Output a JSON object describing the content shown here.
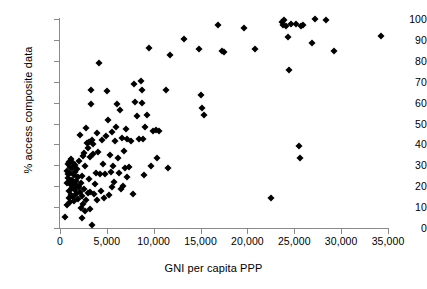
{
  "chart_data": {
    "type": "scatter",
    "title": "",
    "xlabel": "GNI per capita PPP",
    "ylabel": "% access composite data",
    "xlim": [
      0,
      35000
    ],
    "ylim": [
      0,
      100
    ],
    "xticks": [
      0,
      5000,
      10000,
      15000,
      20000,
      25000,
      30000,
      35000
    ],
    "xtick_labels": [
      "0",
      "5,000",
      "10,000",
      "15,000",
      "20,000",
      "25,000",
      "30,000",
      "35,000"
    ],
    "yticks": [
      0,
      10,
      20,
      30,
      40,
      50,
      60,
      70,
      80,
      90,
      100
    ],
    "ytick_labels": [
      "0",
      "10",
      "20",
      "30",
      "40",
      "50",
      "60",
      "70",
      "80",
      "90",
      "100"
    ],
    "grid": false,
    "legend": false,
    "marker": "diamond",
    "marker_color": "#000000",
    "series": [
      {
        "name": "countries",
        "points": [
          [
            520,
            5.2
          ],
          [
            700,
            21.5
          ],
          [
            780,
            11.0
          ],
          [
            800,
            27.5
          ],
          [
            830,
            30.5
          ],
          [
            860,
            26.0
          ],
          [
            900,
            24.0
          ],
          [
            930,
            14.5
          ],
          [
            950,
            31.5
          ],
          [
            980,
            22.0
          ],
          [
            1010,
            17.5
          ],
          [
            1050,
            29.0
          ],
          [
            1080,
            12.5
          ],
          [
            1120,
            26.5
          ],
          [
            1150,
            20.5
          ],
          [
            1180,
            33.0
          ],
          [
            1200,
            16.0
          ],
          [
            1250,
            23.0
          ],
          [
            1290,
            28.5
          ],
          [
            1320,
            19.0
          ],
          [
            1360,
            31.0
          ],
          [
            1400,
            15.0
          ],
          [
            1450,
            25.5
          ],
          [
            1480,
            21.0
          ],
          [
            1520,
            13.0
          ],
          [
            1560,
            27.0
          ],
          [
            1600,
            18.0
          ],
          [
            1650,
            30.0
          ],
          [
            1700,
            22.5
          ],
          [
            1750,
            16.5
          ],
          [
            1800,
            20.0
          ],
          [
            1850,
            28.0
          ],
          [
            1900,
            14.0
          ],
          [
            1950,
            24.5
          ],
          [
            2000,
            32.0
          ],
          [
            2050,
            19.5
          ],
          [
            2100,
            17.0
          ],
          [
            2150,
            44.5
          ],
          [
            2200,
            9.5
          ],
          [
            2250,
            21.5
          ],
          [
            2300,
            4.8
          ],
          [
            2350,
            15.5
          ],
          [
            2400,
            25.0
          ],
          [
            2450,
            11.5
          ],
          [
            2500,
            34.5
          ],
          [
            2550,
            18.5
          ],
          [
            2600,
            36.0
          ],
          [
            2650,
            29.5
          ],
          [
            2700,
            8.0
          ],
          [
            2750,
            47.8
          ],
          [
            2800,
            13.5
          ],
          [
            2900,
            40.5
          ],
          [
            2950,
            16.8
          ],
          [
            3000,
            38.5
          ],
          [
            3050,
            23.5
          ],
          [
            3100,
            41.0
          ],
          [
            3150,
            17.2
          ],
          [
            3200,
            34.0
          ],
          [
            3250,
            9.2
          ],
          [
            3300,
            66.0
          ],
          [
            3350,
            59.5
          ],
          [
            3400,
            1.2
          ],
          [
            3450,
            42.0
          ],
          [
            3500,
            35.5
          ],
          [
            3550,
            40.0
          ],
          [
            3600,
            16.5
          ],
          [
            3700,
            21.0
          ],
          [
            3800,
            26.5
          ],
          [
            3900,
            13.5
          ],
          [
            4000,
            45.5
          ],
          [
            4100,
            36.5
          ],
          [
            4200,
            78.8
          ],
          [
            4300,
            25.8
          ],
          [
            4400,
            17.5
          ],
          [
            4500,
            42.0
          ],
          [
            4600,
            30.5
          ],
          [
            4700,
            14.5
          ],
          [
            4800,
            26.0
          ],
          [
            4900,
            44.0
          ],
          [
            5000,
            65.5
          ],
          [
            5100,
            51.8
          ],
          [
            5200,
            16.0
          ],
          [
            5300,
            35.0
          ],
          [
            5400,
            27.0
          ],
          [
            5500,
            19.5
          ],
          [
            5600,
            46.0
          ],
          [
            5700,
            29.5
          ],
          [
            5800,
            22.0
          ],
          [
            5900,
            41.5
          ],
          [
            6000,
            48.5
          ],
          [
            6100,
            59.5
          ],
          [
            6200,
            33.5
          ],
          [
            6300,
            26.5
          ],
          [
            6400,
            56.5
          ],
          [
            6500,
            18.5
          ],
          [
            6600,
            43.0
          ],
          [
            6700,
            20.0
          ],
          [
            6800,
            37.0
          ],
          [
            6900,
            28.5
          ],
          [
            7000,
            47.5
          ],
          [
            7100,
            24.5
          ],
          [
            7200,
            42.5
          ],
          [
            7400,
            29.0
          ],
          [
            7600,
            41.5
          ],
          [
            7800,
            16.2
          ],
          [
            7900,
            69.0
          ],
          [
            8000,
            60.5
          ],
          [
            8200,
            53.5
          ],
          [
            8400,
            42.5
          ],
          [
            8600,
            70.5
          ],
          [
            8700,
            66.0
          ],
          [
            8800,
            60.0
          ],
          [
            8900,
            42.5
          ],
          [
            9000,
            25.5
          ],
          [
            9100,
            48.5
          ],
          [
            9300,
            54.0
          ],
          [
            9500,
            86.0
          ],
          [
            9700,
            29.5
          ],
          [
            9900,
            46.5
          ],
          [
            10200,
            47.0
          ],
          [
            10400,
            33.5
          ],
          [
            10600,
            46.5
          ],
          [
            11300,
            66.0
          ],
          [
            11500,
            28.5
          ],
          [
            11700,
            83.0
          ],
          [
            13200,
            90.5
          ],
          [
            14800,
            85.5
          ],
          [
            15000,
            63.5
          ],
          [
            15100,
            57.5
          ],
          [
            15400,
            54.0
          ],
          [
            16900,
            97.0
          ],
          [
            17300,
            84.5
          ],
          [
            17500,
            84.0
          ],
          [
            19600,
            95.5
          ],
          [
            20800,
            85.5
          ],
          [
            22500,
            14.2
          ],
          [
            23700,
            98.8
          ],
          [
            23800,
            97.0
          ],
          [
            23900,
            99.5
          ],
          [
            24100,
            96.8
          ],
          [
            24300,
            91.5
          ],
          [
            24400,
            75.5
          ],
          [
            24700,
            97.8
          ],
          [
            25200,
            97.5
          ],
          [
            25500,
            39.0
          ],
          [
            25600,
            33.5
          ],
          [
            25700,
            96.5
          ],
          [
            25900,
            97.0
          ],
          [
            26900,
            88.5
          ],
          [
            27200,
            100.2
          ],
          [
            28400,
            99.5
          ],
          [
            29200,
            84.5
          ],
          [
            34200,
            91.8
          ]
        ]
      }
    ]
  }
}
